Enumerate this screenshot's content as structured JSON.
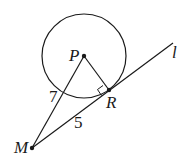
{
  "diagram": {
    "type": "geometry",
    "points": {
      "P": {
        "label": "P",
        "x": 84,
        "y": 56
      },
      "R": {
        "label": "R",
        "x": 109,
        "y": 90
      },
      "M": {
        "label": "M",
        "x": 32,
        "y": 148
      }
    },
    "circle": {
      "center": "P",
      "r": 42
    },
    "line": {
      "label": "l",
      "from": "M",
      "through": "R"
    },
    "segments": [
      {
        "from": "M",
        "to": "P",
        "length_label": "7"
      },
      {
        "from": "M",
        "to": "R",
        "length_label": "5"
      },
      {
        "from": "P",
        "to": "R",
        "length_label": ""
      }
    ],
    "right_angle_at": "R",
    "colors": {
      "stroke": "#1a1a1a",
      "background": "#ffffff"
    }
  }
}
